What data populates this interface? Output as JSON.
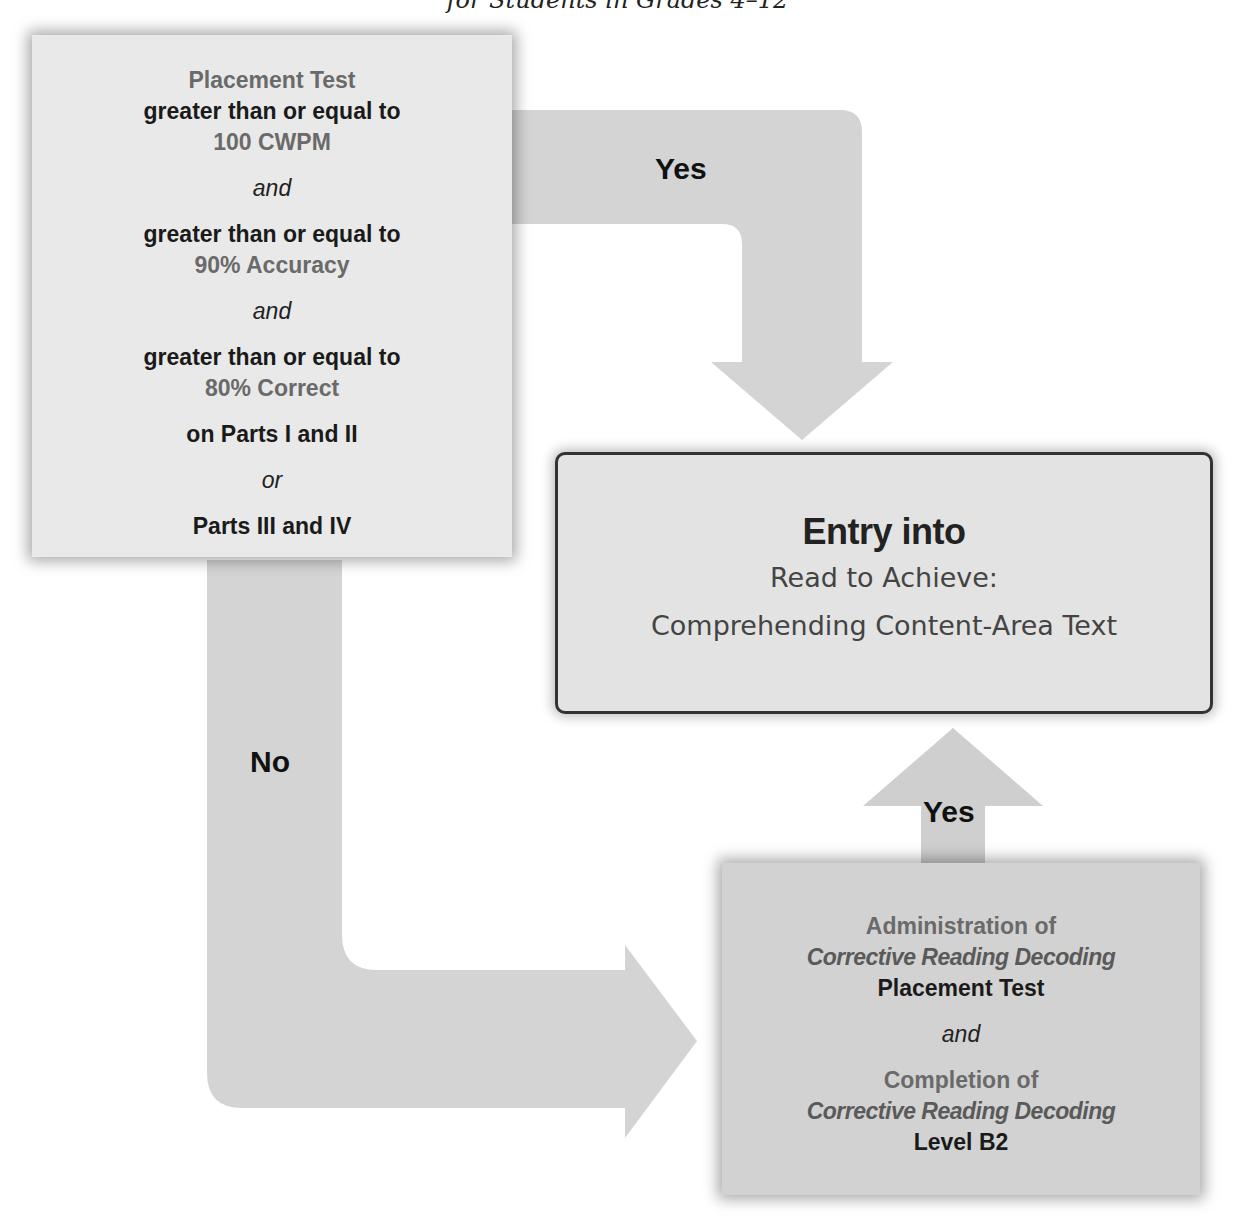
{
  "header": {
    "title_fragment": "for Students in Grades 4–12"
  },
  "placement_box": {
    "lines": [
      "Placement Test",
      "greater than or equal to",
      "100 CWPM",
      "and",
      "greater than or equal to",
      "90% Accuracy",
      "and",
      "greater than or equal to",
      "80% Correct",
      "on Parts I and II",
      "or",
      "Parts III and IV"
    ]
  },
  "arrows": {
    "top_yes": "Yes",
    "no": "No",
    "bottom_yes": "Yes"
  },
  "entry_box": {
    "title": "Entry into",
    "subtitle_1": "Read to Achieve:",
    "subtitle_2": "Comprehending Content-Area Text"
  },
  "corrective_box": {
    "lines": [
      "Administration of",
      "Corrective Reading Decoding",
      "Placement Test",
      "and",
      "Completion of",
      "Corrective Reading Decoding",
      "Level B2"
    ]
  },
  "colors": {
    "arrow_fill": "#d4d4d4",
    "box_light": "#e9e9e9",
    "box_dark": "#d2d2d2",
    "border": "#333333",
    "text_dark": "#1a1a1a",
    "text_gray": "#6a6a6a"
  }
}
